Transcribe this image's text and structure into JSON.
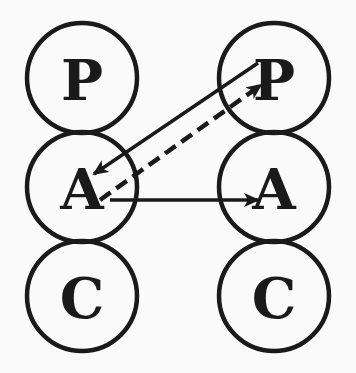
{
  "diagram": {
    "type": "transactional-analysis-ego-state-diagram",
    "left_person": {
      "nodes": [
        {
          "label": "P",
          "cx": 82,
          "cy": 78
        },
        {
          "label": "A",
          "cx": 82,
          "cy": 186
        },
        {
          "label": "C",
          "cx": 82,
          "cy": 295
        }
      ]
    },
    "right_person": {
      "nodes": [
        {
          "label": "P",
          "cx": 274,
          "cy": 78
        },
        {
          "label": "A",
          "cx": 274,
          "cy": 186
        },
        {
          "label": "C",
          "cx": 274,
          "cy": 295
        }
      ]
    },
    "node_radius": 55,
    "arrows": [
      {
        "from": "right.P",
        "to": "left.A",
        "style": "solid",
        "x1": 258,
        "y1": 63,
        "x2": 94,
        "y2": 174
      },
      {
        "from": "left.A",
        "to": "right.P",
        "style": "dashed",
        "x1": 100,
        "y1": 200,
        "x2": 261,
        "y2": 85
      },
      {
        "from": "left.A",
        "to": "right.A",
        "style": "solid",
        "x1": 110,
        "y1": 200,
        "x2": 258,
        "y2": 200
      }
    ],
    "colors": {
      "stroke": "#1a1a1a",
      "background": "#fafafa"
    }
  }
}
